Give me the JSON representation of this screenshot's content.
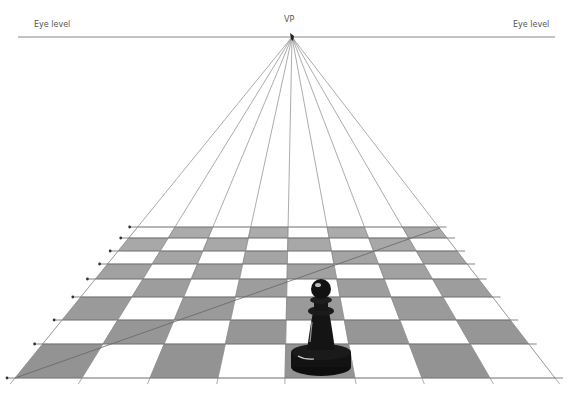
{
  "labels": {
    "eye_level_left": "Eye level",
    "eye_level_right": "Eye level",
    "vanishing_point": "VP"
  },
  "geometry": {
    "vp": [
      292,
      37
    ],
    "horizon": {
      "y": 37,
      "x1": 18,
      "x2": 555
    },
    "row_lines_y": [
      227,
      238,
      251,
      264,
      279,
      297,
      320,
      344,
      378
    ],
    "bottom_column_x": [
      15,
      82,
      150,
      218,
      285,
      355,
      422,
      490,
      555
    ],
    "diagonal": {
      "from": [
        15,
        378
      ],
      "to": [
        440,
        228
      ]
    }
  },
  "board": {
    "rows": 8,
    "cols": 8,
    "pattern_note": "alternating dark/light; bottom-left square dark",
    "colors": {
      "dark": "#8f8f8f",
      "light": "#ffffff",
      "lines": "#777777"
    }
  },
  "piece": {
    "type": "pawn",
    "color": "#111111",
    "position": {
      "col": 4,
      "row": 0
    }
  }
}
